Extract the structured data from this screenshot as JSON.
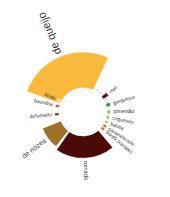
{
  "chart_data": {
    "type": "radial-bar",
    "title": "",
    "center": [
      83,
      112
    ],
    "inner_radius": 22,
    "max_radius": 60,
    "categories": [
      {
        "label": "de queijo",
        "value": 1.0,
        "color": "#F9B93C",
        "start": -70,
        "end": 25,
        "font": 11,
        "big": true
      },
      {
        "label": "mel",
        "value": 0.18,
        "color": "#5E0F2E",
        "start": 50,
        "end": 58,
        "font": 5
      },
      {
        "label": "gorduroso",
        "value": 0.12,
        "color": "#2E8B3A",
        "start": 70,
        "end": 78,
        "font": 5
      },
      {
        "label": "pimentão",
        "value": 0.1,
        "color": "#8DC63F",
        "start": 86,
        "end": 94,
        "font": 5
      },
      {
        "label": "cogumelo",
        "value": 0.08,
        "color": "#8DC63F",
        "start": 98,
        "end": 106,
        "font": 5
      },
      {
        "label": "batata",
        "value": 0.08,
        "color": "#8DC63F",
        "start": 110,
        "end": 116,
        "font": 5
      },
      {
        "label": "caramelizado",
        "value": 0.1,
        "color": "#D2691E",
        "start": 120,
        "end": 126,
        "font": 5
      },
      {
        "label": "bordô (xarope)",
        "value": 0.1,
        "color": "#D2691E",
        "start": 127,
        "end": 133,
        "font": 5
      },
      {
        "label": "torrado",
        "value": 0.62,
        "color": "#4A0A0A",
        "start": 140,
        "end": 215,
        "font": 6
      },
      {
        "label": "de nozes",
        "value": 0.55,
        "color": "#A0702A",
        "start": 218,
        "end": 248,
        "font": 7
      },
      {
        "label": "defumado",
        "value": 0.12,
        "color": "#7A2E10",
        "start": 262,
        "end": 268,
        "font": 5
      },
      {
        "label": "baunilha",
        "value": 0.12,
        "color": "#D94A1E",
        "start": 280,
        "end": 286,
        "font": 5
      },
      {
        "label": "ácido",
        "value": 0.1,
        "color": "#F5C86A",
        "start": 292,
        "end": 298,
        "font": 5
      }
    ]
  }
}
